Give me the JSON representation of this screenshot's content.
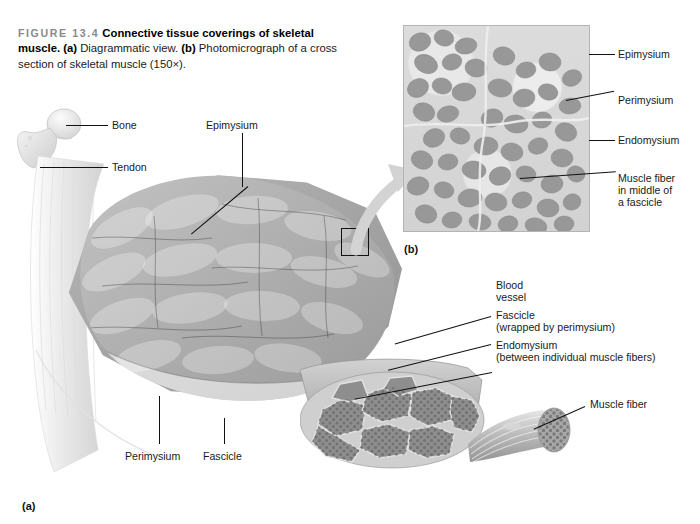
{
  "figure": {
    "number": "FIGURE 13.4",
    "title": "Connective tissue coverings of skeletal muscle.",
    "part_a_marker": "(a)",
    "part_a_text": "Diagrammatic view.",
    "part_b_marker": "(b)",
    "part_b_text": "Photomicrograph of a cross section of skeletal muscle (150×).",
    "panel_a_label": "(a)",
    "panel_b_label": "(b)"
  },
  "diagram_labels": {
    "bone": "Bone",
    "tendon": "Tendon",
    "epimysium": "Epimysium",
    "perimysium": "Perimysium",
    "fascicle": "Fascicle",
    "blood_vessel_line1": "Blood",
    "blood_vessel_line2": "vessel",
    "fascicle_wrapped_line1": "Fascicle",
    "fascicle_wrapped_line2": "(wrapped by perimysium)",
    "endomysium_line1": "Endomysium",
    "endomysium_line2": "(between individual muscle fibers)",
    "muscle_fiber": "Muscle fiber"
  },
  "micrograph_labels": {
    "epimysium": "Epimysium",
    "perimysium": "Perimysium",
    "endomysium": "Endomysium",
    "muscle_fiber_line1": "Muscle fiber",
    "muscle_fiber_line2": "in middle of",
    "muscle_fiber_line3": "a fascicle"
  },
  "colors": {
    "background": "#ffffff",
    "text": "#1a1a1a",
    "figure_number": "#8a8a8a",
    "leader_line": "#111111",
    "muscle_mid_gray": "#a6a6a6",
    "muscle_dark_gray": "#8f8f8f",
    "micrograph_matrix": "#dcdcdc",
    "micrograph_fiber": "#9a9a9a",
    "bone_light": "#ededed",
    "arrow_gray": "#d0d0d0"
  }
}
